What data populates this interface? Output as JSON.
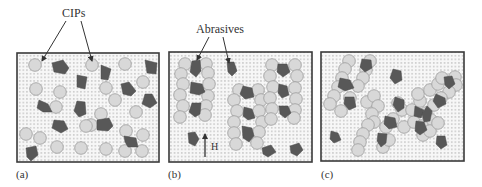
{
  "figure": {
    "width": 482,
    "height": 187,
    "colors": {
      "background": "#ffffff",
      "medium_fill": "#f7f7f7",
      "medium_dot": "#9a9a9a",
      "frame": "#3a3a3a",
      "cip_fill": "#d8d8d8",
      "cip_stroke": "#9c9c9c",
      "abrasive_fill": "#585858",
      "text": "#333333",
      "arrow": "#333333"
    },
    "particle_radius": 6.3
  },
  "annotations": {
    "cips": {
      "label": "CIPs",
      "x": 62,
      "y": 17,
      "arrows": [
        {
          "x1": 66,
          "y1": 21,
          "x2": 42,
          "y2": 61
        },
        {
          "x1": 81,
          "y1": 21,
          "x2": 92,
          "y2": 61
        }
      ]
    },
    "abrasives": {
      "label": "Abrasives",
      "x": 196,
      "y": 33,
      "arrows": [
        {
          "x1": 209,
          "y1": 37,
          "x2": 197,
          "y2": 60
        },
        {
          "x1": 223,
          "y1": 37,
          "x2": 229,
          "y2": 63
        }
      ]
    },
    "field": {
      "label": "H",
      "arrow": {
        "x1": 205,
        "y1": 157,
        "x2": 205,
        "y2": 134
      },
      "label_x": 211,
      "label_y": 150
    }
  },
  "panels": [
    {
      "id": "a",
      "label": "(a)",
      "label_x": 16,
      "label_y": 178,
      "frame": {
        "x": 17,
        "y": 53,
        "w": 142,
        "h": 109
      },
      "cips": [
        [
          35,
          65
        ],
        [
          92,
          65
        ],
        [
          125,
          64
        ],
        [
          143,
          82
        ],
        [
          36,
          89
        ],
        [
          60,
          92
        ],
        [
          56,
          107
        ],
        [
          106,
          88
        ],
        [
          115,
          100
        ],
        [
          101,
          114
        ],
        [
          91,
          125
        ],
        [
          136,
          112
        ],
        [
          26,
          134
        ],
        [
          40,
          138
        ],
        [
          86,
          126
        ],
        [
          81,
          148
        ],
        [
          57,
          147
        ],
        [
          126,
          131
        ],
        [
          143,
          135
        ],
        [
          106,
          149
        ],
        [
          125,
          151
        ],
        [
          142,
          151
        ]
      ],
      "abrasives": [
        [
          [
            52,
            63
          ],
          [
            63,
            60
          ],
          [
            69,
            68
          ],
          [
            65,
            74
          ],
          [
            54,
            72
          ]
        ],
        [
          [
            101,
            65
          ],
          [
            111,
            69
          ],
          [
            108,
            80
          ],
          [
            101,
            79
          ]
        ],
        [
          [
            145,
            60
          ],
          [
            157,
            63
          ],
          [
            156,
            74
          ],
          [
            147,
            73
          ]
        ],
        [
          [
            77,
            75
          ],
          [
            87,
            77
          ],
          [
            85,
            89
          ],
          [
            77,
            87
          ]
        ],
        [
          [
            121,
            84
          ],
          [
            129,
            82
          ],
          [
            136,
            91
          ],
          [
            131,
            96
          ],
          [
            123,
            94
          ]
        ],
        [
          [
            145,
            94
          ],
          [
            152,
            94
          ],
          [
            157,
            103
          ],
          [
            150,
            108
          ],
          [
            142,
            104
          ]
        ],
        [
          [
            39,
            100
          ],
          [
            48,
            104
          ],
          [
            52,
            112
          ],
          [
            43,
            112
          ],
          [
            37,
            108
          ]
        ],
        [
          [
            77,
            101
          ],
          [
            85,
            102
          ],
          [
            86,
            114
          ],
          [
            79,
            117
          ],
          [
            74,
            111
          ]
        ],
        [
          [
            54,
            120
          ],
          [
            64,
            121
          ],
          [
            68,
            129
          ],
          [
            61,
            133
          ],
          [
            52,
            128
          ]
        ],
        [
          [
            97,
            120
          ],
          [
            109,
            118
          ],
          [
            113,
            126
          ],
          [
            108,
            131
          ],
          [
            97,
            130
          ]
        ],
        [
          [
            124,
            136
          ],
          [
            136,
            138
          ],
          [
            138,
            147
          ],
          [
            128,
            147
          ],
          [
            125,
            142
          ]
        ],
        [
          [
            26,
            148
          ],
          [
            36,
            146
          ],
          [
            38,
            155
          ],
          [
            31,
            161
          ],
          [
            27,
            157
          ]
        ]
      ]
    },
    {
      "id": "b",
      "label": "(b)",
      "label_x": 168,
      "label_y": 178,
      "frame": {
        "x": 169,
        "y": 52,
        "w": 143,
        "h": 110
      },
      "cips": [
        [
          185,
          64
        ],
        [
          206,
          64
        ],
        [
          181,
          74
        ],
        [
          208,
          73
        ],
        [
          183,
          84
        ],
        [
          209,
          84
        ],
        [
          180,
          95
        ],
        [
          208,
          96
        ],
        [
          183,
          106
        ],
        [
          206,
          106
        ],
        [
          180,
          117
        ],
        [
          205,
          115
        ],
        [
          239,
          90
        ],
        [
          258,
          90
        ],
        [
          234,
          100
        ],
        [
          261,
          100
        ],
        [
          237,
          111
        ],
        [
          259,
          111
        ],
        [
          234,
          122
        ],
        [
          262,
          122
        ],
        [
          234,
          133
        ],
        [
          259,
          132
        ],
        [
          236,
          144
        ],
        [
          257,
          143
        ],
        [
          272,
          65
        ],
        [
          295,
          65
        ],
        [
          270,
          76
        ],
        [
          297,
          76
        ],
        [
          273,
          87
        ],
        [
          295,
          88
        ],
        [
          270,
          98
        ],
        [
          296,
          99
        ],
        [
          272,
          109
        ],
        [
          295,
          110
        ],
        [
          271,
          119
        ],
        [
          294,
          118
        ]
      ],
      "abrasives": [
        [
          [
            192,
            61
          ],
          [
            200,
            60
          ],
          [
            201,
            71
          ],
          [
            196,
            77
          ],
          [
            190,
            72
          ]
        ],
        [
          [
            227,
            62
          ],
          [
            234,
            62
          ],
          [
            237,
            71
          ],
          [
            232,
            76
          ],
          [
            228,
            72
          ]
        ],
        [
          [
            191,
            82
          ],
          [
            202,
            84
          ],
          [
            205,
            92
          ],
          [
            199,
            95
          ],
          [
            190,
            93
          ]
        ],
        [
          [
            192,
            103
          ],
          [
            201,
            103
          ],
          [
            200,
            114
          ],
          [
            195,
            117
          ],
          [
            189,
            112
          ]
        ],
        [
          [
            243,
            86
          ],
          [
            252,
            88
          ],
          [
            254,
            97
          ],
          [
            245,
            99
          ],
          [
            240,
            94
          ]
        ],
        [
          [
            244,
            107
          ],
          [
            252,
            109
          ],
          [
            255,
            118
          ],
          [
            248,
            120
          ],
          [
            243,
            116
          ]
        ],
        [
          [
            242,
            126
          ],
          [
            252,
            128
          ],
          [
            254,
            136
          ],
          [
            249,
            142
          ],
          [
            243,
            138
          ]
        ],
        [
          [
            278,
            64
          ],
          [
            287,
            64
          ],
          [
            290,
            72
          ],
          [
            283,
            77
          ],
          [
            277,
            72
          ]
        ],
        [
          [
            279,
            84
          ],
          [
            287,
            86
          ],
          [
            289,
            95
          ],
          [
            282,
            98
          ],
          [
            278,
            93
          ]
        ],
        [
          [
            279,
            106
          ],
          [
            288,
            106
          ],
          [
            291,
            113
          ],
          [
            285,
            118
          ],
          [
            280,
            114
          ]
        ],
        [
          [
            188,
            133
          ],
          [
            195,
            132
          ],
          [
            199,
            139
          ],
          [
            195,
            146
          ],
          [
            189,
            143
          ]
        ],
        [
          [
            262,
            148
          ],
          [
            271,
            145
          ],
          [
            276,
            152
          ],
          [
            268,
            157
          ],
          [
            263,
            154
          ]
        ],
        [
          [
            290,
            146
          ],
          [
            299,
            143
          ],
          [
            303,
            150
          ],
          [
            297,
            156
          ],
          [
            291,
            153
          ]
        ]
      ]
    },
    {
      "id": "c",
      "label": "(c)",
      "label_x": 321,
      "label_y": 178,
      "frame": {
        "x": 321,
        "y": 52,
        "w": 143,
        "h": 109
      },
      "cips": [
        [
          349,
          61
        ],
        [
          370,
          61
        ],
        [
          345,
          69
        ],
        [
          366,
          70
        ],
        [
          342,
          78
        ],
        [
          363,
          78
        ],
        [
          338,
          87
        ],
        [
          358,
          86
        ],
        [
          334,
          96
        ],
        [
          350,
          98
        ],
        [
          330,
          104
        ],
        [
          341,
          111
        ],
        [
          367,
          102
        ],
        [
          374,
          96
        ],
        [
          378,
          106
        ],
        [
          372,
          114
        ],
        [
          374,
          122
        ],
        [
          368,
          125
        ],
        [
          363,
          134
        ],
        [
          360,
          142
        ],
        [
          358,
          150
        ],
        [
          383,
          147
        ],
        [
          389,
          140
        ],
        [
          386,
          127
        ],
        [
          398,
          103
        ],
        [
          402,
          110
        ],
        [
          393,
          119
        ],
        [
          404,
          127
        ],
        [
          414,
          122
        ],
        [
          412,
          110
        ],
        [
          420,
          101
        ],
        [
          418,
          94
        ],
        [
          430,
          90
        ],
        [
          438,
          84
        ],
        [
          442,
          78
        ],
        [
          455,
          77
        ],
        [
          456,
          85
        ],
        [
          449,
          92
        ],
        [
          441,
          98
        ],
        [
          434,
          105
        ],
        [
          426,
          113
        ],
        [
          431,
          120
        ],
        [
          422,
          126
        ],
        [
          423,
          135
        ],
        [
          430,
          131
        ],
        [
          438,
          123
        ]
      ],
      "abrasives": [
        [
          [
            362,
            59
          ],
          [
            371,
            60
          ],
          [
            372,
            68
          ],
          [
            365,
            72
          ],
          [
            360,
            67
          ]
        ],
        [
          [
            340,
            78
          ],
          [
            350,
            80
          ],
          [
            354,
            88
          ],
          [
            345,
            91
          ],
          [
            338,
            87
          ]
        ],
        [
          [
            345,
            97
          ],
          [
            354,
            97
          ],
          [
            356,
            107
          ],
          [
            349,
            110
          ],
          [
            344,
            104
          ]
        ],
        [
          [
            393,
            69
          ],
          [
            401,
            71
          ],
          [
            402,
            80
          ],
          [
            395,
            84
          ],
          [
            390,
            78
          ]
        ],
        [
          [
            395,
            97
          ],
          [
            404,
            100
          ],
          [
            404,
            108
          ],
          [
            398,
            112
          ],
          [
            393,
            105
          ]
        ],
        [
          [
            385,
            116
          ],
          [
            395,
            118
          ],
          [
            397,
            127
          ],
          [
            389,
            129
          ],
          [
            384,
            124
          ]
        ],
        [
          [
            378,
            133
          ],
          [
            387,
            134
          ],
          [
            386,
            143
          ],
          [
            381,
            147
          ],
          [
            377,
            141
          ]
        ],
        [
          [
            415,
            106
          ],
          [
            424,
            110
          ],
          [
            421,
            118
          ],
          [
            414,
            116
          ]
        ],
        [
          [
            444,
            77
          ],
          [
            452,
            76
          ],
          [
            455,
            84
          ],
          [
            449,
            89
          ],
          [
            445,
            85
          ]
        ],
        [
          [
            436,
            94
          ],
          [
            445,
            98
          ],
          [
            446,
            104
          ],
          [
            438,
            108
          ],
          [
            433,
            101
          ]
        ],
        [
          [
            427,
            106
          ],
          [
            432,
            111
          ],
          [
            430,
            121
          ],
          [
            424,
            122
          ],
          [
            422,
            114
          ]
        ],
        [
          [
            416,
            121
          ],
          [
            424,
            122
          ],
          [
            427,
            130
          ],
          [
            420,
            135
          ],
          [
            415,
            131
          ]
        ],
        [
          [
            331,
            131
          ],
          [
            338,
            133
          ],
          [
            341,
            140
          ],
          [
            334,
            143
          ],
          [
            330,
            139
          ]
        ],
        [
          [
            437,
            136
          ],
          [
            445,
            136
          ],
          [
            447,
            145
          ],
          [
            441,
            149
          ],
          [
            436,
            144
          ]
        ]
      ]
    }
  ]
}
